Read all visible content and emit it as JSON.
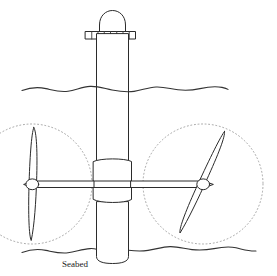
{
  "figure": {
    "domain_type": "diagram",
    "canvas": {
      "width": 277,
      "height": 276
    },
    "background_color": "#ffffff",
    "line_color": "#2b2b2b",
    "dashed_color": "#9a9a9a"
  },
  "labels": {
    "seabed": "Seabed"
  },
  "parts": {
    "mast_cap": "mast-cap-dome",
    "platform_deck": "platform-deck",
    "tower": "support-tower",
    "collar": "tower-collar",
    "cross_shaft": "nacelle-cross-shaft",
    "left_turbine": "left-turbine-assembly",
    "right_turbine": "right-turbine-assembly",
    "water_surface": "water-surface-line",
    "seabed_line": "seabed-line"
  },
  "geometry": {
    "water_line_y": 89,
    "seabed_line_y": 251,
    "tower_left_x": 96,
    "tower_right_x": 129,
    "tower_top_y": 40,
    "tower_bottom_y": 262,
    "collar_top_y": 160,
    "collar_bottom_y": 203,
    "collar_left_x": 93,
    "collar_right_x": 132,
    "deck_y": 34,
    "deck_left_x": 85,
    "deck_right_x": 136,
    "deck_cells": 8,
    "hub_left_center": {
      "x": 32,
      "y": 184
    },
    "hub_right_center": {
      "x": 203,
      "y": 184
    },
    "swept_radius": 60,
    "left_blade_tilt_deg": -5,
    "right_blade_tilt_deg": 20
  },
  "deck_cell_labels": [
    "",
    "",
    "",
    "",
    "",
    "",
    "",
    ""
  ]
}
